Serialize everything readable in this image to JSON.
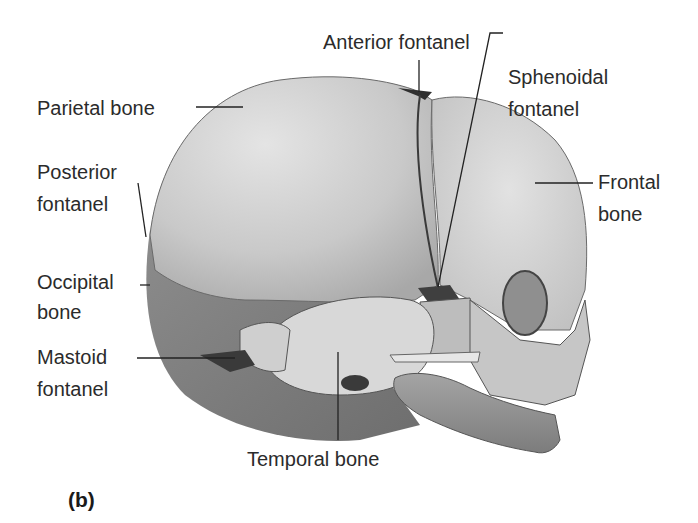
{
  "figure": {
    "panel_label": "(b)",
    "labels": {
      "anterior_fontanel": "Anterior fontanel",
      "parietal_bone": "Parietal bone",
      "sphenoidal_fontanel_1": "Sphenoidal",
      "sphenoidal_fontanel_2": "fontanel",
      "posterior_fontanel_1": "Posterior",
      "posterior_fontanel_2": "fontanel",
      "frontal_bone_1": "Frontal",
      "frontal_bone_2": "bone",
      "occipital_bone_1": "Occipital",
      "occipital_bone_2": "bone",
      "mastoid_fontanel_1": "Mastoid",
      "mastoid_fontanel_2": "fontanel",
      "temporal_bone": "Temporal bone"
    },
    "colors": {
      "bone_light": "#d4d4d4",
      "bone_mid": "#b5b5b5",
      "bone_dark": "#8a8a8a",
      "fontanel": "#4a4a4a",
      "leader_line": "#222222",
      "text": "#2b2b2b"
    }
  }
}
